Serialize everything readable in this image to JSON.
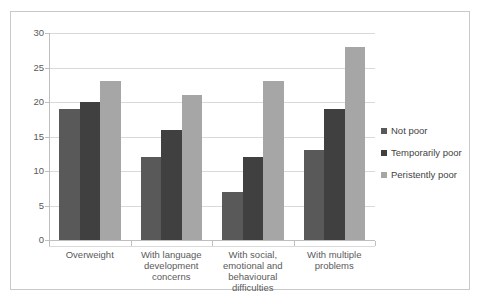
{
  "chart_data": {
    "type": "bar",
    "title": "",
    "subtitle": "",
    "xlabel": "",
    "ylabel": "",
    "ylim": [
      0,
      30
    ],
    "ytick_values": [
      0,
      5,
      10,
      15,
      20,
      25,
      30
    ],
    "ytick_labels": [
      "0",
      "5",
      "10",
      "15",
      "20",
      "25",
      "30"
    ],
    "grid": true,
    "legend_position": "right",
    "categories": [
      "Overweight",
      "With language development concerns",
      "With social, emotional and behavioural difficulties",
      "With multiple problems"
    ],
    "category_lines": [
      [
        "Overweight"
      ],
      [
        "With language",
        "development",
        "concerns"
      ],
      [
        "With social,",
        "emotional and",
        "behavioural",
        "difficulties"
      ],
      [
        "With multiple",
        "problems"
      ]
    ],
    "series": [
      {
        "name": "Not poor",
        "color": "#595959",
        "values": [
          19,
          12,
          7,
          13
        ]
      },
      {
        "name": "Temporarily poor",
        "color": "#404040",
        "values": [
          20,
          16,
          12,
          19
        ]
      },
      {
        "name": "Peristently poor",
        "color": "#a6a6a6",
        "values": [
          23,
          21,
          23,
          28
        ]
      }
    ]
  },
  "legend": {
    "items": [
      {
        "label": "Not poor",
        "color": "#595959"
      },
      {
        "label": "Temporarily poor",
        "color": "#404040"
      },
      {
        "label": "Peristently poor",
        "color": "#a6a6a6"
      }
    ]
  },
  "caption": {
    "text": ""
  },
  "colors": {
    "not_poor": "#595959",
    "temporarily_poor": "#404040",
    "peristently_poor": "#a6a6a6",
    "gridline": "#d9d9d9",
    "axis": "#bfbfbf",
    "frame": "#c9c9c9",
    "text": "#3f3f3f"
  }
}
